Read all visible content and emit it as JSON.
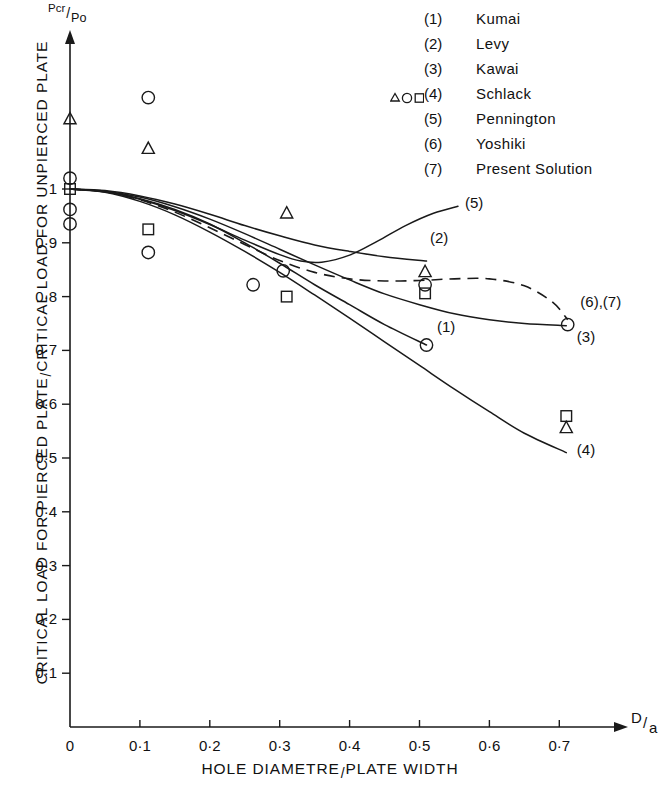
{
  "axes": {
    "y_arrow_label": {
      "numerator": "Pcr",
      "denominator": "Po"
    },
    "x_arrow_label": {
      "numerator": "D",
      "denominator": "a"
    },
    "y_title_part1": "CRITICAL LOAD FOR PIERCED PLATE",
    "y_title_part2": "CRITICAL LOAD FOR UNPIERCED PLATE",
    "x_title_part1": "HOLE DIAMETRE",
    "x_title_part2": "PLATE WIDTH",
    "y_ticks": [
      "1",
      "0·9",
      "0·8",
      "0·7",
      "0·6",
      "0·5",
      "0·4",
      "0·3",
      "0·2",
      "0·1"
    ],
    "x_ticks": [
      "0",
      "0·1",
      "0·2",
      "0·3",
      "0·4",
      "0·5",
      "0·6",
      "0·7"
    ]
  },
  "legend": {
    "entries": [
      {
        "num": "(1)",
        "name": "Kumai",
        "symbols": ""
      },
      {
        "num": "(2)",
        "name": "Levy",
        "symbols": ""
      },
      {
        "num": "(3)",
        "name": "Kawai",
        "symbols": ""
      },
      {
        "num": "(4)",
        "name": "Schlack",
        "symbols": "triangle-circle-square"
      },
      {
        "num": "(5)",
        "name": "Pennington",
        "symbols": ""
      },
      {
        "num": "(6)",
        "name": "Yoshiki",
        "symbols": ""
      },
      {
        "num": "(7)",
        "name": "Present Solution",
        "symbols": ""
      }
    ]
  },
  "curve_labels": [
    {
      "text": "(1)",
      "x": 0.525,
      "y": 0.735
    },
    {
      "text": "(2)",
      "x": 0.515,
      "y": 0.9
    },
    {
      "text": "(3)",
      "x": 0.725,
      "y": 0.715
    },
    {
      "text": "(4)",
      "x": 0.725,
      "y": 0.505
    },
    {
      "text": "(5)",
      "x": 0.565,
      "y": 0.965
    },
    {
      "text": "(6),(7)",
      "x": 0.73,
      "y": 0.78
    }
  ],
  "chart_data": {
    "type": "line",
    "title": "",
    "xlabel": "HOLE DIAMETRE / PLATE WIDTH  (D/a)",
    "ylabel": "CRITICAL LOAD FOR PIERCED PLATE / CRITICAL LOAD FOR UNPIERCED PLATE  (Pcr/Po)",
    "xlim": [
      0,
      0.78
    ],
    "ylim": [
      0,
      1.22
    ],
    "grid": false,
    "legend_position": "top-right",
    "series": [
      {
        "name": "(1) Kumai",
        "style": "solid",
        "points": [
          [
            0.0,
            1.0
          ],
          [
            0.05,
            0.995
          ],
          [
            0.1,
            0.982
          ],
          [
            0.15,
            0.962
          ],
          [
            0.2,
            0.935
          ],
          [
            0.25,
            0.9
          ],
          [
            0.3,
            0.862
          ],
          [
            0.35,
            0.822
          ],
          [
            0.4,
            0.785
          ],
          [
            0.45,
            0.748
          ],
          [
            0.51,
            0.71
          ]
        ]
      },
      {
        "name": "(2) Levy",
        "style": "solid",
        "points": [
          [
            0.0,
            1.0
          ],
          [
            0.05,
            0.997
          ],
          [
            0.1,
            0.987
          ],
          [
            0.15,
            0.972
          ],
          [
            0.2,
            0.953
          ],
          [
            0.25,
            0.932
          ],
          [
            0.3,
            0.913
          ],
          [
            0.35,
            0.896
          ],
          [
            0.4,
            0.884
          ],
          [
            0.45,
            0.874
          ],
          [
            0.51,
            0.866
          ]
        ]
      },
      {
        "name": "(3) Kawai",
        "style": "solid",
        "points": [
          [
            0.0,
            1.0
          ],
          [
            0.05,
            0.996
          ],
          [
            0.1,
            0.985
          ],
          [
            0.15,
            0.967
          ],
          [
            0.2,
            0.944
          ],
          [
            0.25,
            0.917
          ],
          [
            0.3,
            0.888
          ],
          [
            0.35,
            0.859
          ],
          [
            0.4,
            0.831
          ],
          [
            0.45,
            0.805
          ],
          [
            0.5,
            0.785
          ],
          [
            0.55,
            0.768
          ],
          [
            0.6,
            0.757
          ],
          [
            0.65,
            0.75
          ],
          [
            0.71,
            0.746
          ]
        ]
      },
      {
        "name": "(4) Schlack",
        "style": "solid",
        "points": [
          [
            0.0,
            1.0
          ],
          [
            0.05,
            0.994
          ],
          [
            0.1,
            0.977
          ],
          [
            0.15,
            0.952
          ],
          [
            0.2,
            0.92
          ],
          [
            0.25,
            0.884
          ],
          [
            0.3,
            0.845
          ],
          [
            0.35,
            0.803
          ],
          [
            0.4,
            0.76
          ],
          [
            0.45,
            0.716
          ],
          [
            0.5,
            0.672
          ],
          [
            0.55,
            0.628
          ],
          [
            0.6,
            0.586
          ],
          [
            0.65,
            0.546
          ],
          [
            0.71,
            0.51
          ]
        ]
      },
      {
        "name": "(5) Pennington",
        "style": "solid",
        "points": [
          [
            0.0,
            1.0
          ],
          [
            0.05,
            0.995
          ],
          [
            0.1,
            0.981
          ],
          [
            0.15,
            0.96
          ],
          [
            0.2,
            0.934
          ],
          [
            0.25,
            0.905
          ],
          [
            0.3,
            0.878
          ],
          [
            0.33,
            0.866
          ],
          [
            0.36,
            0.864
          ],
          [
            0.4,
            0.877
          ],
          [
            0.44,
            0.903
          ],
          [
            0.48,
            0.932
          ],
          [
            0.52,
            0.955
          ],
          [
            0.555,
            0.968
          ]
        ]
      },
      {
        "name": "(6),(7) Yoshiki / Present Solution",
        "style": "dashed",
        "points": [
          [
            0.0,
            1.0
          ],
          [
            0.05,
            0.995
          ],
          [
            0.1,
            0.98
          ],
          [
            0.15,
            0.957
          ],
          [
            0.2,
            0.928
          ],
          [
            0.25,
            0.897
          ],
          [
            0.3,
            0.867
          ],
          [
            0.35,
            0.845
          ],
          [
            0.4,
            0.833
          ],
          [
            0.45,
            0.829
          ],
          [
            0.5,
            0.83
          ],
          [
            0.55,
            0.833
          ],
          [
            0.6,
            0.833
          ],
          [
            0.65,
            0.82
          ],
          [
            0.69,
            0.79
          ],
          [
            0.712,
            0.757
          ]
        ]
      }
    ],
    "markers": [
      {
        "shape": "triangle",
        "x": 0.0,
        "y": 1.13
      },
      {
        "shape": "circle",
        "x": 0.0,
        "y": 1.02
      },
      {
        "shape": "square",
        "x": 0.0,
        "y": 1.0
      },
      {
        "shape": "circle",
        "x": 0.0,
        "y": 0.962
      },
      {
        "shape": "circle",
        "x": 0.0,
        "y": 0.935
      },
      {
        "shape": "circle",
        "x": 0.112,
        "y": 1.17
      },
      {
        "shape": "triangle",
        "x": 0.112,
        "y": 1.075
      },
      {
        "shape": "square",
        "x": 0.112,
        "y": 0.925
      },
      {
        "shape": "circle",
        "x": 0.112,
        "y": 0.882
      },
      {
        "shape": "circle",
        "x": 0.262,
        "y": 0.822
      },
      {
        "shape": "triangle",
        "x": 0.31,
        "y": 0.955
      },
      {
        "shape": "circle",
        "x": 0.305,
        "y": 0.848
      },
      {
        "shape": "square",
        "x": 0.31,
        "y": 0.8
      },
      {
        "shape": "triangle",
        "x": 0.508,
        "y": 0.846
      },
      {
        "shape": "circle",
        "x": 0.508,
        "y": 0.822
      },
      {
        "shape": "square",
        "x": 0.508,
        "y": 0.806
      },
      {
        "shape": "circle",
        "x": 0.51,
        "y": 0.71
      },
      {
        "shape": "circle",
        "x": 0.712,
        "y": 0.748
      },
      {
        "shape": "square",
        "x": 0.71,
        "y": 0.578
      },
      {
        "shape": "triangle",
        "x": 0.71,
        "y": 0.556
      }
    ]
  }
}
